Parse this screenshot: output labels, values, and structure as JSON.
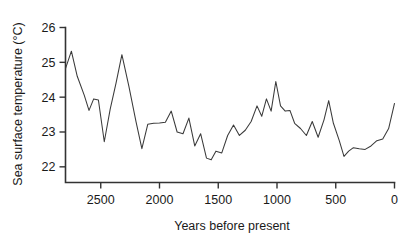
{
  "chart_data": {
    "type": "line",
    "title": "",
    "xlabel": "Years before present",
    "ylabel": "Sea surface temperature (°C)",
    "xlim": [
      2800,
      0
    ],
    "ylim": [
      21.55,
      26.0
    ],
    "x_ticks": [
      2500,
      2000,
      1500,
      1000,
      500,
      0
    ],
    "x_tick_labels": [
      "2500",
      "2000",
      "1500",
      "1000",
      "500",
      "0"
    ],
    "y_ticks": [
      22,
      23,
      24,
      25,
      26
    ],
    "y_tick_labels": [
      "22",
      "23",
      "24",
      "25",
      "26"
    ],
    "grid": false,
    "legend": "none",
    "x_axis_reversed": true,
    "series": [
      {
        "name": "Sea surface temperature",
        "color": "#3a3a3a",
        "x": [
          2800,
          2750,
          2700,
          2640,
          2600,
          2560,
          2520,
          2470,
          2420,
          2370,
          2320,
          2260,
          2200,
          2150,
          2100,
          2050,
          2000,
          1950,
          1900,
          1850,
          1800,
          1750,
          1700,
          1650,
          1600,
          1560,
          1520,
          1470,
          1420,
          1370,
          1320,
          1270,
          1220,
          1170,
          1130,
          1090,
          1050,
          1010,
          970,
          930,
          890,
          850,
          800,
          750,
          700,
          650,
          600,
          560,
          520,
          470,
          430,
          390,
          350,
          300,
          250,
          200,
          150,
          100,
          50,
          0
        ],
        "y": [
          24.82,
          25.32,
          24.6,
          24.05,
          23.62,
          23.95,
          23.92,
          22.72,
          23.65,
          24.4,
          25.22,
          24.3,
          23.3,
          22.52,
          23.22,
          23.25,
          23.26,
          23.28,
          23.6,
          23.0,
          22.95,
          23.4,
          22.6,
          22.95,
          22.25,
          22.2,
          22.45,
          22.4,
          22.9,
          23.2,
          22.9,
          23.05,
          23.3,
          23.75,
          23.45,
          23.95,
          23.6,
          24.45,
          23.75,
          23.6,
          23.62,
          23.25,
          23.1,
          22.9,
          23.3,
          22.85,
          23.35,
          23.9,
          23.25,
          22.75,
          22.3,
          22.45,
          22.55,
          22.52,
          22.5,
          22.6,
          22.75,
          22.8,
          23.1,
          23.82
        ]
      }
    ]
  }
}
